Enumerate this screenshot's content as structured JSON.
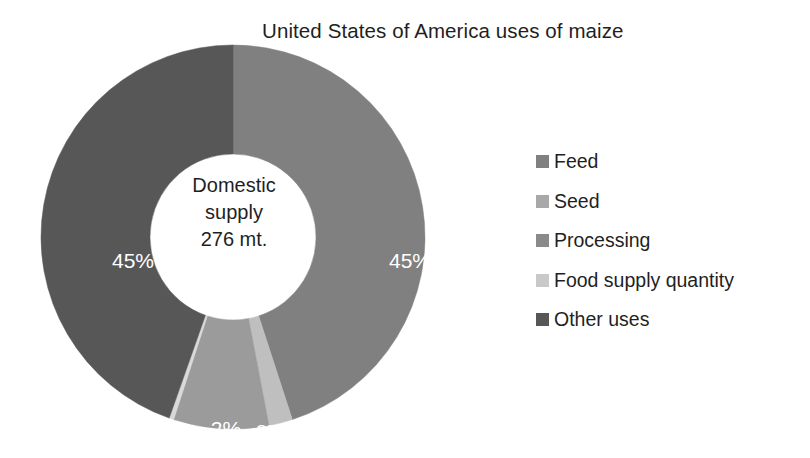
{
  "chart_data": {
    "type": "pie",
    "variant": "donut",
    "title": "United States of America uses of maize",
    "xlabel": "",
    "ylabel": "",
    "grid": false,
    "legend_position": "right",
    "center_label": {
      "line1": "Domestic",
      "line2": "supply",
      "line3": "276 mt."
    },
    "units": "mt.",
    "total": 276,
    "categories": [
      "Feed",
      "Seed",
      "Processing",
      "Food supply quantity",
      "Other uses"
    ],
    "values": [
      45,
      2,
      8,
      0,
      45
    ],
    "data_labels": [
      "45%",
      "2%",
      "8%",
      "0%",
      "45%"
    ],
    "colors": [
      "#808080",
      "#bfbfbf",
      "#9b9b9b",
      "#d9d9d9",
      "#575757"
    ],
    "slices": [
      {
        "name": "Feed",
        "value": 45,
        "label": "45%",
        "color": "#808080",
        "start_deg": 0,
        "end_deg": 162
      },
      {
        "name": "Seed",
        "value": 2,
        "label": "2%",
        "color": "#bfbfbf",
        "start_deg": 162,
        "end_deg": 169.2
      },
      {
        "name": "Processing",
        "value": 8,
        "label": "8%",
        "color": "#9b9b9b",
        "start_deg": 169.2,
        "end_deg": 198
      },
      {
        "name": "Food supply quantity",
        "value": 0,
        "label": "0%",
        "color": "#d9d9d9",
        "start_deg": 198,
        "end_deg": 199.4
      },
      {
        "name": "Other uses",
        "value": 45,
        "label": "45%",
        "color": "#575757",
        "start_deg": 199.4,
        "end_deg": 360
      }
    ]
  },
  "legend": {
    "items": [
      {
        "label": "Feed",
        "color": "#808080"
      },
      {
        "label": "Seed",
        "color": "#a8a8a8"
      },
      {
        "label": "Processing",
        "color": "#8a8a8a"
      },
      {
        "label": "Food supply quantity",
        "color": "#c9c9c9"
      },
      {
        "label": "Other uses",
        "color": "#575757"
      }
    ]
  },
  "labels": {
    "other_uses_pct": "45%",
    "feed_pct": "45%",
    "seed_pct": "2%",
    "processing_pct": "8%",
    "food_supply_pct": "0%"
  }
}
